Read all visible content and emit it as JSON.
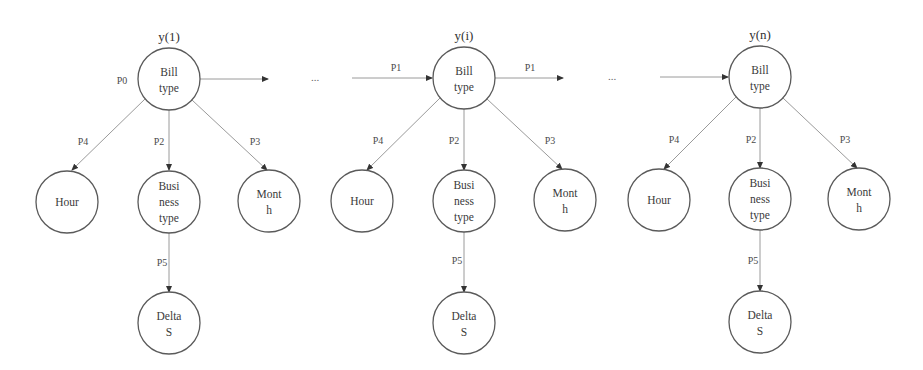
{
  "diagram": {
    "colors": {
      "node_stroke": "#5a5a5a",
      "edge_stroke": "#9a9a9a",
      "text": "#3a3a3a",
      "background": "#ffffff"
    },
    "ellipsis": "...",
    "groups": [
      {
        "step_label": "y(1)",
        "root": {
          "line1": "Bill",
          "line2": "type"
        },
        "root_incoming_label": "P0",
        "outgoing_label": "",
        "children": {
          "hour": {
            "line1": "Hour"
          },
          "business": {
            "line1": "Busi",
            "line2": "ness",
            "line3": "type"
          },
          "month": {
            "line1": "Mont",
            "line2": "h"
          },
          "delta": {
            "line1": "Delta",
            "line2": "S"
          }
        },
        "edge_labels": {
          "to_hour": "P4",
          "to_business": "P2",
          "to_month": "P3",
          "to_delta": "P5"
        }
      },
      {
        "step_label": "y(i)",
        "root": {
          "line1": "Bill",
          "line2": "type"
        },
        "incoming_label": "P1",
        "outgoing_label": "P1",
        "children": {
          "hour": {
            "line1": "Hour"
          },
          "business": {
            "line1": "Busi",
            "line2": "ness",
            "line3": "type"
          },
          "month": {
            "line1": "Mont",
            "line2": "h"
          },
          "delta": {
            "line1": "Delta",
            "line2": "S"
          }
        },
        "edge_labels": {
          "to_hour": "P4",
          "to_business": "P2",
          "to_month": "P3",
          "to_delta": "P5"
        }
      },
      {
        "step_label": "y(n)",
        "root": {
          "line1": "Bill",
          "line2": "type"
        },
        "incoming_label": "",
        "children": {
          "hour": {
            "line1": "Hour"
          },
          "business": {
            "line1": "Busi",
            "line2": "ness",
            "line3": "type"
          },
          "month": {
            "line1": "Mont",
            "line2": "h"
          },
          "delta": {
            "line1": "Delta",
            "line2": "S"
          }
        },
        "edge_labels": {
          "to_hour": "P4",
          "to_business": "P2",
          "to_month": "P3",
          "to_delta": "P5"
        }
      }
    ]
  }
}
